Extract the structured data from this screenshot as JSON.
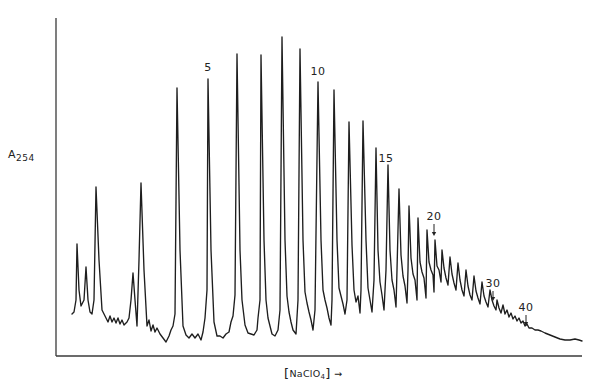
{
  "chart_data": {
    "type": "line",
    "title": "",
    "xlabel": "[NaClO4] →",
    "xlabel_parts": {
      "prefix": "NaClO",
      "subscript": "4",
      "arrow": "→"
    },
    "ylabel": "A254",
    "ylabel_parts": {
      "main": "A",
      "subscript": "254"
    },
    "grid": false,
    "legend": null,
    "axes": {
      "origin_px": [
        56,
        356
      ],
      "x_end_px": 582,
      "y_top_px": 18
    },
    "annotations": [
      {
        "text": "5",
        "peak_index": 5,
        "x": 208,
        "y": 62,
        "arrow": false
      },
      {
        "text": "10",
        "peak_index": 10,
        "x": 318,
        "y": 66,
        "arrow": false
      },
      {
        "text": "15",
        "peak_index": 15,
        "x": 386,
        "y": 153,
        "arrow": false
      },
      {
        "text": "20",
        "peak_index": 20,
        "x": 434,
        "y": 211,
        "arrow": true,
        "arrow_from": 224,
        "arrow_to": 236
      },
      {
        "text": "30",
        "peak_index": 30,
        "x": 493,
        "y": 278,
        "arrow": true,
        "arrow_from": 291,
        "arrow_to": 301
      },
      {
        "text": "40",
        "peak_index": 40,
        "x": 526,
        "y": 302,
        "arrow": true,
        "arrow_from": 315,
        "arrow_to": 326
      }
    ],
    "main_peaks": [
      {
        "n": 1,
        "x": 96,
        "y": 187
      },
      {
        "n": 3,
        "x": 141,
        "y": 183
      },
      {
        "n": 4,
        "x": 177,
        "y": 88
      },
      {
        "n": 5,
        "x": 208,
        "y": 79
      },
      {
        "n": 6,
        "x": 237,
        "y": 54
      },
      {
        "n": 7,
        "x": 261,
        "y": 55
      },
      {
        "n": 8,
        "x": 282,
        "y": 37
      },
      {
        "n": 9,
        "x": 300,
        "y": 49
      },
      {
        "n": 10,
        "x": 318,
        "y": 82
      },
      {
        "n": 11,
        "x": 334,
        "y": 90
      },
      {
        "n": 12,
        "x": 349,
        "y": 122
      },
      {
        "n": 13,
        "x": 363,
        "y": 121
      },
      {
        "n": 14,
        "x": 376,
        "y": 148
      },
      {
        "n": 15,
        "x": 388,
        "y": 165
      },
      {
        "n": 16,
        "x": 399,
        "y": 189
      },
      {
        "n": 17,
        "x": 409,
        "y": 206
      },
      {
        "n": 18,
        "x": 418,
        "y": 218
      },
      {
        "n": 19,
        "x": 427,
        "y": 230
      },
      {
        "n": 20,
        "x": 435,
        "y": 240
      }
    ],
    "trace_points": [
      [
        72,
        314
      ],
      [
        74,
        312
      ],
      [
        76,
        300
      ],
      [
        77,
        244
      ],
      [
        79,
        290
      ],
      [
        81,
        306
      ],
      [
        84,
        300
      ],
      [
        86,
        267
      ],
      [
        88,
        300
      ],
      [
        90,
        312
      ],
      [
        92,
        314
      ],
      [
        94,
        300
      ],
      [
        96,
        187
      ],
      [
        99,
        260
      ],
      [
        102,
        310
      ],
      [
        105,
        316
      ],
      [
        108,
        322
      ],
      [
        110,
        316
      ],
      [
        112,
        322
      ],
      [
        114,
        318
      ],
      [
        116,
        323
      ],
      [
        118,
        318
      ],
      [
        120,
        324
      ],
      [
        122,
        320
      ],
      [
        124,
        325
      ],
      [
        127,
        322
      ],
      [
        129,
        318
      ],
      [
        131,
        300
      ],
      [
        133,
        273
      ],
      [
        135,
        300
      ],
      [
        137,
        326
      ],
      [
        139,
        260
      ],
      [
        141,
        183
      ],
      [
        144,
        270
      ],
      [
        147,
        326
      ],
      [
        149,
        320
      ],
      [
        151,
        331
      ],
      [
        153,
        325
      ],
      [
        155,
        332
      ],
      [
        157,
        328
      ],
      [
        160,
        334
      ],
      [
        163,
        338
      ],
      [
        166,
        342
      ],
      [
        169,
        336
      ],
      [
        171,
        330
      ],
      [
        173,
        326
      ],
      [
        175,
        314
      ],
      [
        177,
        88
      ],
      [
        180,
        250
      ],
      [
        183,
        326
      ],
      [
        186,
        335
      ],
      [
        189,
        338
      ],
      [
        192,
        334
      ],
      [
        195,
        338
      ],
      [
        198,
        334
      ],
      [
        201,
        340
      ],
      [
        203,
        332
      ],
      [
        205,
        318
      ],
      [
        207,
        290
      ],
      [
        208,
        79
      ],
      [
        211,
        250
      ],
      [
        214,
        322
      ],
      [
        217,
        336
      ],
      [
        220,
        336
      ],
      [
        223,
        338
      ],
      [
        226,
        334
      ],
      [
        229,
        332
      ],
      [
        231,
        322
      ],
      [
        233,
        316
      ],
      [
        235,
        295
      ],
      [
        237,
        54
      ],
      [
        240,
        250
      ],
      [
        242,
        300
      ],
      [
        245,
        325
      ],
      [
        248,
        333
      ],
      [
        251,
        334
      ],
      [
        254,
        335
      ],
      [
        257,
        330
      ],
      [
        258,
        318
      ],
      [
        260,
        300
      ],
      [
        261,
        55
      ],
      [
        264,
        240
      ],
      [
        266,
        300
      ],
      [
        268,
        318
      ],
      [
        270,
        326
      ],
      [
        272,
        334
      ],
      [
        275,
        336
      ],
      [
        278,
        330
      ],
      [
        280,
        310
      ],
      [
        282,
        37
      ],
      [
        285,
        240
      ],
      [
        287,
        296
      ],
      [
        289,
        312
      ],
      [
        291,
        322
      ],
      [
        293,
        330
      ],
      [
        296,
        334
      ],
      [
        298,
        300
      ],
      [
        300,
        49
      ],
      [
        303,
        240
      ],
      [
        305,
        292
      ],
      [
        307,
        303
      ],
      [
        309,
        312
      ],
      [
        311,
        320
      ],
      [
        313,
        330
      ],
      [
        315,
        310
      ],
      [
        318,
        82
      ],
      [
        321,
        240
      ],
      [
        323,
        290
      ],
      [
        325,
        300
      ],
      [
        327,
        308
      ],
      [
        329,
        318
      ],
      [
        331,
        325
      ],
      [
        332,
        300
      ],
      [
        334,
        90
      ],
      [
        337,
        240
      ],
      [
        339,
        288
      ],
      [
        341,
        296
      ],
      [
        343,
        304
      ],
      [
        345,
        314
      ],
      [
        347,
        300
      ],
      [
        349,
        122
      ],
      [
        352,
        245
      ],
      [
        354,
        290
      ],
      [
        356,
        302
      ],
      [
        358,
        296
      ],
      [
        360,
        313
      ],
      [
        361,
        290
      ],
      [
        363,
        121
      ],
      [
        366,
        240
      ],
      [
        368,
        288
      ],
      [
        370,
        300
      ],
      [
        372,
        312
      ],
      [
        374,
        280
      ],
      [
        376,
        148
      ],
      [
        378,
        250
      ],
      [
        380,
        282
      ],
      [
        382,
        295
      ],
      [
        384,
        310
      ],
      [
        386,
        270
      ],
      [
        388,
        165
      ],
      [
        390,
        250
      ],
      [
        392,
        280
      ],
      [
        394,
        290
      ],
      [
        396,
        307
      ],
      [
        397,
        270
      ],
      [
        399,
        189
      ],
      [
        401,
        255
      ],
      [
        403,
        276
      ],
      [
        405,
        286
      ],
      [
        407,
        303
      ],
      [
        408,
        270
      ],
      [
        409,
        206
      ],
      [
        411,
        258
      ],
      [
        413,
        274
      ],
      [
        415,
        280
      ],
      [
        417,
        300
      ],
      [
        418,
        218
      ],
      [
        420,
        262
      ],
      [
        422,
        272
      ],
      [
        424,
        278
      ],
      [
        426,
        298
      ],
      [
        427,
        230
      ],
      [
        429,
        262
      ],
      [
        431,
        270
      ],
      [
        433,
        275
      ],
      [
        434,
        292
      ],
      [
        435,
        240
      ],
      [
        437,
        266
      ],
      [
        439,
        270
      ],
      [
        441,
        282
      ],
      [
        442,
        250
      ],
      [
        444,
        268
      ],
      [
        446,
        278
      ],
      [
        448,
        285
      ],
      [
        450,
        257
      ],
      [
        452,
        274
      ],
      [
        454,
        283
      ],
      [
        456,
        290
      ],
      [
        458,
        263
      ],
      [
        460,
        280
      ],
      [
        462,
        290
      ],
      [
        464,
        296
      ],
      [
        466,
        270
      ],
      [
        468,
        286
      ],
      [
        470,
        295
      ],
      [
        472,
        300
      ],
      [
        474,
        276
      ],
      [
        476,
        291
      ],
      [
        478,
        298
      ],
      [
        480,
        304
      ],
      [
        482,
        282
      ],
      [
        484,
        296
      ],
      [
        486,
        302
      ],
      [
        488,
        307
      ],
      [
        490,
        290
      ],
      [
        492,
        300
      ],
      [
        494,
        306
      ],
      [
        496,
        310
      ],
      [
        497,
        300
      ],
      [
        499,
        308
      ],
      [
        501,
        313
      ],
      [
        503,
        305
      ],
      [
        505,
        314
      ],
      [
        507,
        310
      ],
      [
        509,
        317
      ],
      [
        511,
        313
      ],
      [
        513,
        319
      ],
      [
        515,
        316
      ],
      [
        517,
        321
      ],
      [
        519,
        318
      ],
      [
        521,
        323
      ],
      [
        523,
        321
      ],
      [
        525,
        326
      ],
      [
        527,
        324
      ],
      [
        529,
        328
      ],
      [
        532,
        328
      ],
      [
        535,
        330
      ],
      [
        538,
        330
      ],
      [
        541,
        331
      ],
      [
        545,
        333
      ],
      [
        550,
        335
      ],
      [
        555,
        337
      ],
      [
        560,
        339
      ],
      [
        565,
        340
      ],
      [
        570,
        340
      ],
      [
        575,
        339
      ],
      [
        579,
        340
      ],
      [
        582,
        341
      ]
    ]
  }
}
